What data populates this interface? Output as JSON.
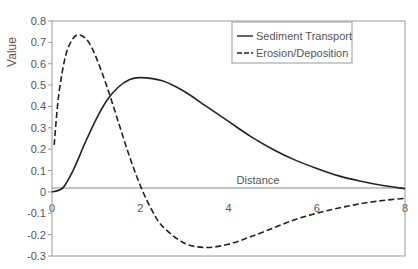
{
  "chart_data": {
    "type": "line",
    "title": "",
    "xlabel": "Distance",
    "ylabel": "Value",
    "xlim": [
      0,
      8
    ],
    "ylim": [
      -0.3,
      0.8
    ],
    "x_ticks": [
      "0",
      "2",
      "4",
      "6",
      "8"
    ],
    "y_ticks": [
      "0.8",
      "0.7",
      "0.6",
      "0.5",
      "0.4",
      "0.3",
      "0.2",
      "0.1",
      "0",
      "-0.1",
      "-0.2",
      "-0.3"
    ],
    "grid": false,
    "legend_position": "upper right",
    "series": [
      {
        "name": "Sediment Transport",
        "style": "solid",
        "x": [
          0,
          0.25,
          0.5,
          0.75,
          1.0,
          1.25,
          1.5,
          1.75,
          2.0,
          2.5,
          3.0,
          3.5,
          4.0,
          4.5,
          5.0,
          5.5,
          6.0,
          6.5,
          7.0,
          7.5,
          8.0
        ],
        "values": [
          0,
          0.02,
          0.11,
          0.23,
          0.34,
          0.43,
          0.49,
          0.525,
          0.535,
          0.52,
          0.47,
          0.4,
          0.33,
          0.26,
          0.2,
          0.15,
          0.11,
          0.075,
          0.05,
          0.03,
          0.015
        ]
      },
      {
        "name": "Erosion/Deposition",
        "style": "dashed",
        "x": [
          0.05,
          0.15,
          0.3,
          0.45,
          0.6,
          0.8,
          1.0,
          1.25,
          1.5,
          1.75,
          2.0,
          2.25,
          2.5,
          3.0,
          3.5,
          4.0,
          4.5,
          5.0,
          5.5,
          6.0,
          6.5,
          7.0,
          7.5,
          8.0
        ],
        "values": [
          0.22,
          0.45,
          0.63,
          0.71,
          0.735,
          0.71,
          0.63,
          0.49,
          0.33,
          0.17,
          0.03,
          -0.08,
          -0.16,
          -0.24,
          -0.26,
          -0.245,
          -0.21,
          -0.17,
          -0.13,
          -0.1,
          -0.075,
          -0.055,
          -0.04,
          -0.03
        ]
      }
    ]
  }
}
